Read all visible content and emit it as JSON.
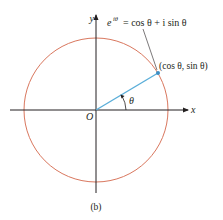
{
  "diagram": {
    "caption": "(b)",
    "axes": {
      "x_label": "x",
      "y_label": "y",
      "origin_label": "O"
    },
    "circle": {
      "name": "unit circle",
      "color": "#d9775e"
    },
    "radius_segment": {
      "color": "#5aaed9"
    },
    "angle_label": "θ",
    "point_label": "(cos θ, sin θ)",
    "formula": {
      "base": "e",
      "exponent": "iθ",
      "rhs": "= cos θ + i sin θ"
    },
    "colors": {
      "axis": "#231f20",
      "circle": "#d9775e",
      "radius": "#5aaed9",
      "point": "#3b8ec4",
      "leader": "#231f20"
    }
  }
}
